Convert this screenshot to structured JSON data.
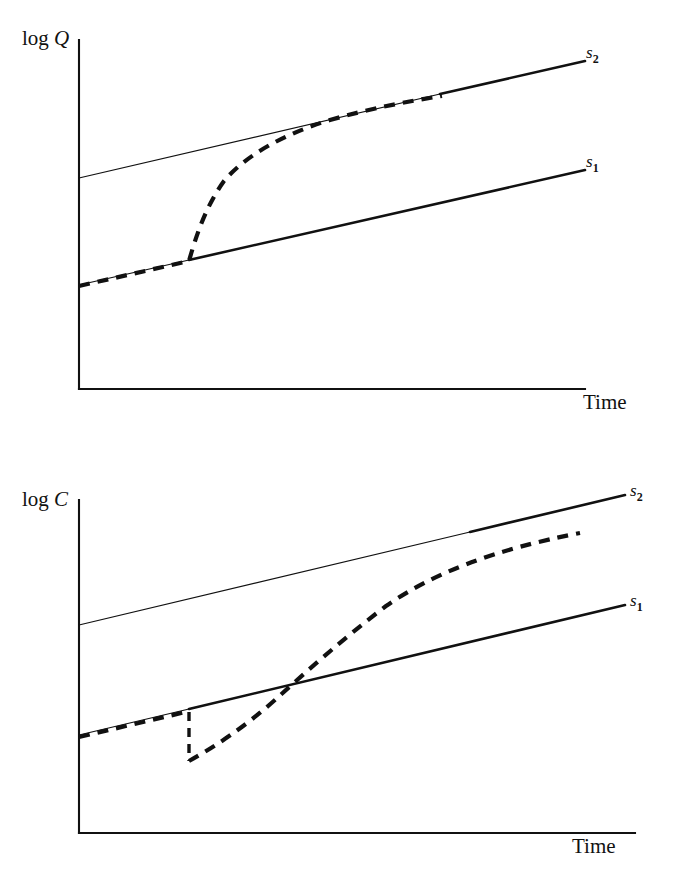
{
  "figure": {
    "type": "line-diagram",
    "background_color": "#ffffff",
    "ink_color": "#111111"
  },
  "chart_data": [
    {
      "type": "line",
      "panel_id": "panel-q",
      "title": "",
      "ylabel": "log Q",
      "xlabel": "Time",
      "grid": false,
      "legend": "inline-right-endpoint-labels",
      "axis": {
        "x_origin_px": 79,
        "y_top_px": 40,
        "x_end_px": 585,
        "y_baseline_px": 389
      },
      "series": [
        {
          "name": "s_1",
          "label": "s",
          "sublabel": "1",
          "style": "solid",
          "weight": "thick-right-of-branch",
          "label_x_px": 588,
          "label_y_px": 166,
          "points": [
            [
              79,
              285
            ],
            [
              585,
              170
            ]
          ]
        },
        {
          "name": "s_2",
          "label": "s",
          "sublabel": "2",
          "style": "solid",
          "weight": "thin-left-of-merge",
          "label_x_px": 588,
          "label_y_px": 57,
          "points": [
            [
              79,
              178
            ],
            [
              585,
              61
            ]
          ]
        },
        {
          "name": "transition-path",
          "label": "",
          "style": "dashed",
          "description": "Output follows s1 path, then at the shock jumps to a steep rise and converges asymptotically onto the s2 path from below",
          "points": [
            [
              79,
              286
            ],
            [
              189,
              261
            ],
            [
              196,
              232
            ],
            [
              205,
              205
            ],
            [
              218,
              183
            ],
            [
              236,
              164
            ],
            [
              258,
              149
            ],
            [
              286,
              136
            ],
            [
              318,
              124
            ],
            [
              352,
              114
            ],
            [
              392,
              105
            ],
            [
              440,
              97
            ]
          ]
        }
      ]
    },
    {
      "type": "line",
      "panel_id": "panel-c",
      "title": "",
      "ylabel": "log C",
      "xlabel": "Time",
      "grid": false,
      "legend": "inline-right-endpoint-labels",
      "axis": {
        "x_origin_px": 79,
        "y_top_px": 60,
        "x_end_px": 635,
        "y_baseline_px": 393
      },
      "series": [
        {
          "name": "s_1",
          "label": "s",
          "sublabel": "1",
          "style": "solid",
          "weight": "thick-right-of-branch",
          "label_x_px": 638,
          "label_y_px": 165,
          "points": [
            [
              79,
              295
            ],
            [
              625,
              165
            ]
          ]
        },
        {
          "name": "s_2",
          "label": "s",
          "sublabel": "2",
          "style": "solid",
          "weight": "thin-left-of-merge",
          "label_x_px": 638,
          "label_y_px": 57,
          "points": [
            [
              79,
              185
            ],
            [
              625,
              55
            ]
          ]
        },
        {
          "name": "transition-path",
          "label": "",
          "style": "dashed",
          "description": "Consumption follows s1 path, drops discontinuously downward at the shock, then rises steeply crossing the s1 path and converges asymptotically onto the s2 path from below",
          "points": [
            [
              79,
              297
            ],
            [
              189,
              272
            ],
            [
              189,
              320
            ],
            [
              215,
              303
            ],
            [
              248,
              282
            ],
            [
              280,
              256
            ],
            [
              310,
              228
            ],
            [
              342,
              200
            ],
            [
              378,
              172
            ],
            [
              418,
              148
            ],
            [
              462,
              128
            ],
            [
              508,
              112
            ],
            [
              560,
              98
            ],
            [
              580,
              94
            ]
          ]
        }
      ]
    }
  ],
  "panels": [
    {
      "id": "panel-q",
      "y_axis_label": "log ",
      "y_axis_variable": "Q",
      "x_axis_label": "Time",
      "curve_labels": [
        {
          "base": "s",
          "sub": "2"
        },
        {
          "base": "s",
          "sub": "1"
        }
      ]
    },
    {
      "id": "panel-c",
      "y_axis_label": "log ",
      "y_axis_variable": "C",
      "x_axis_label": "Time",
      "curve_labels": [
        {
          "base": "s",
          "sub": "2"
        },
        {
          "base": "s",
          "sub": "1"
        }
      ]
    }
  ]
}
